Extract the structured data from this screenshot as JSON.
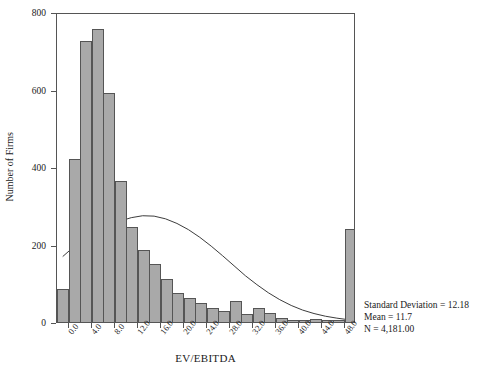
{
  "chart_data": {
    "type": "bar",
    "title": "",
    "xlabel": "EV/EBITDA",
    "ylabel": "Number of Firms",
    "ylim": [
      0,
      800
    ],
    "xlim": [
      -2,
      50
    ],
    "grid": false,
    "legend": null,
    "bin_width": 2,
    "categories": [
      "-2.0",
      "0.0",
      "2.0",
      "4.0",
      "6.0",
      "8.0",
      "10.0",
      "12.0",
      "14.0",
      "16.0",
      "18.0",
      "20.0",
      "22.0",
      "24.0",
      "26.0",
      "28.0",
      "30.0",
      "32.0",
      "34.0",
      "36.0",
      "38.0",
      "40.0",
      "42.0",
      "44.0",
      "46.0",
      "48.0"
    ],
    "values": [
      85,
      420,
      725,
      755,
      590,
      365,
      245,
      185,
      150,
      110,
      75,
      62,
      50,
      35,
      28,
      55,
      20,
      35,
      22,
      10,
      6,
      5,
      8,
      5,
      4,
      240
    ],
    "y_ticks": [
      "0",
      "200",
      "400",
      "600",
      "800"
    ],
    "y_tick_values": [
      0,
      200,
      400,
      600,
      800
    ],
    "x_ticks": [
      "0.0",
      "4.0",
      "8.0",
      "12.0",
      "16.0",
      "20.0",
      "24.0",
      "28.0",
      "32.0",
      "36.0",
      "40.0",
      "44.0",
      "48.0"
    ],
    "x_tick_values": [
      0,
      4,
      8,
      12,
      16,
      20,
      24,
      28,
      32,
      36,
      40,
      44,
      48
    ],
    "overlay": {
      "name": "normal-curve",
      "type": "line",
      "x": [
        -1,
        1,
        3,
        5,
        7,
        9,
        11,
        13,
        15,
        17,
        19,
        21,
        23,
        25,
        27,
        29,
        31,
        33,
        35,
        37,
        39,
        41,
        43,
        45,
        47,
        49
      ],
      "y": [
        170,
        196,
        216,
        234,
        249,
        262,
        271,
        276,
        275,
        268,
        256,
        240,
        220,
        197,
        172,
        146,
        120,
        97,
        76,
        58,
        43,
        31,
        22,
        15,
        10,
        6
      ]
    },
    "annotations": {
      "std_dev": "Standard Deviation = 12.18",
      "mean": "Mean = 11.7",
      "n": "N = 4,181.00"
    },
    "colors": {
      "bar_fill": "#a9a9a9",
      "bar_edge": "#555555",
      "curve": "#3a3a3a",
      "axis": "#555555",
      "text": "#1a1a1a",
      "background": "#ffffff"
    }
  }
}
